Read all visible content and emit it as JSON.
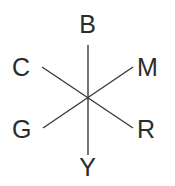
{
  "figure": {
    "type": "color-opponent-axes-diagram",
    "background_color": "#ffffff",
    "line_color": "#3a3a3a",
    "label_color": "#2b2b2b",
    "center": {
      "x": 88,
      "y": 97
    },
    "labels": {
      "top": "B",
      "upper_right": "M",
      "lower_right": "R",
      "bottom": "Y",
      "lower_left": "G",
      "upper_left": "C"
    },
    "axes": [
      {
        "name": "vertical-axis",
        "from_label": "B",
        "to_label": "Y",
        "x1": 88,
        "y1": 45,
        "x2": 88,
        "y2": 155
      },
      {
        "name": "diagonal-axis-c-r",
        "from_label": "C",
        "to_label": "R",
        "x1": 42,
        "y1": 67,
        "x2": 133,
        "y2": 128
      },
      {
        "name": "diagonal-axis-g-m",
        "from_label": "G",
        "to_label": "M",
        "x1": 43,
        "y1": 128,
        "x2": 133,
        "y2": 67
      }
    ]
  }
}
